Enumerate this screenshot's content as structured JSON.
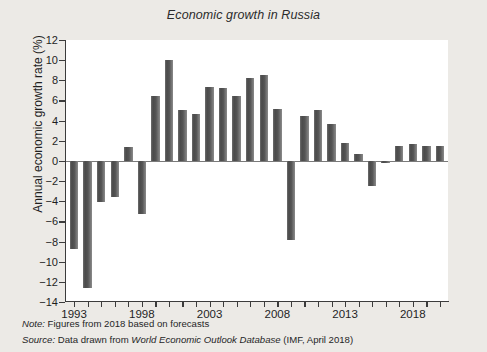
{
  "chart_data": {
    "type": "bar",
    "title": "Economic growth in Russia",
    "xlabel": "",
    "ylabel": "Annual economic growth rate (%)",
    "ylim": [
      -14,
      12
    ],
    "ytick_step": 2,
    "yticks": [
      12,
      10,
      8,
      6,
      4,
      2,
      0,
      -2,
      -4,
      -6,
      -8,
      -10,
      -12,
      -14
    ],
    "ytick_labels": [
      "12",
      "10",
      "8",
      "6",
      "4",
      "2",
      "0",
      "−2",
      "−4",
      "−6",
      "−8",
      "−10",
      "−12",
      "−14"
    ],
    "xlim": [
      1992.4,
      2020.6
    ],
    "xtick_labels": [
      "1993",
      "1998",
      "2003",
      "2008",
      "2013",
      "2018"
    ],
    "xtick_label_years": [
      1993,
      1998,
      2003,
      2008,
      2013,
      2018
    ],
    "minor_tick_years": [
      1993,
      1994,
      1995,
      1996,
      1997,
      1998,
      1999,
      2000,
      2001,
      2002,
      2003,
      2004,
      2005,
      2006,
      2007,
      2008,
      2009,
      2010,
      2011,
      2012,
      2013,
      2014,
      2015,
      2016,
      2017,
      2018,
      2019,
      2020
    ],
    "grid": false,
    "legend": "none",
    "bar_color": "#565656",
    "plot_background": "#ffffff",
    "figure_background": "#eceae6",
    "categories": [
      1993,
      1994,
      1995,
      1996,
      1997,
      1998,
      1999,
      2000,
      2001,
      2002,
      2003,
      2004,
      2005,
      2006,
      2007,
      2008,
      2009,
      2010,
      2011,
      2012,
      2013,
      2014,
      2015,
      2016,
      2017,
      2018,
      2019,
      2020
    ],
    "values": [
      -8.7,
      -12.6,
      -4.1,
      -3.6,
      1.4,
      -5.3,
      6.4,
      10.0,
      5.1,
      4.7,
      7.3,
      7.2,
      6.4,
      8.2,
      8.5,
      5.2,
      -7.8,
      4.5,
      5.1,
      3.7,
      1.8,
      0.7,
      -2.5,
      -0.2,
      1.5,
      1.7,
      1.5,
      1.5
    ],
    "series": [
      {
        "name": "Annual economic growth rate (%)",
        "values": [
          -8.7,
          -12.6,
          -4.1,
          -3.6,
          1.4,
          -5.3,
          6.4,
          10.0,
          5.1,
          4.7,
          7.3,
          7.2,
          6.4,
          8.2,
          8.5,
          5.2,
          -7.8,
          4.5,
          5.1,
          3.7,
          1.8,
          0.7,
          -2.5,
          -0.2,
          1.5,
          1.7,
          1.5,
          1.5
        ]
      }
    ]
  },
  "notes": {
    "note_lead": "Note:",
    "note_text": " Figures from 2018 based on forecasts",
    "source_lead": "Source:",
    "source_text_before": " Data drawn from ",
    "source_emphasis": "World Economic Outlook Database",
    "source_text_after": " (IMF, April 2018)"
  }
}
